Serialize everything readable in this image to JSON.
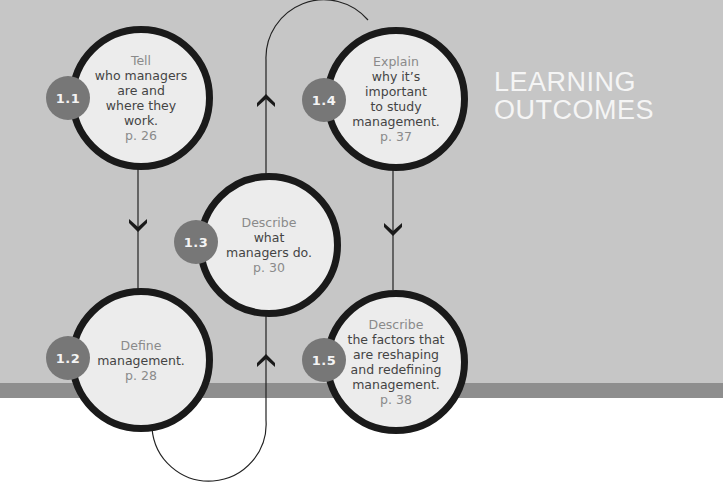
{
  "title": {
    "line1": "LEARNING",
    "line2": "OUTCOMES"
  },
  "colors": {
    "background": "#c6c6c6",
    "band": "#8e8e8e",
    "circle_fill": "#ececec",
    "circle_border": "#1a1a1a",
    "badge": "#777777"
  },
  "outcomes": [
    {
      "number": "1.1",
      "verb": "Tell",
      "description": [
        "who managers",
        "are and",
        "where they",
        "work."
      ],
      "page": "p. 26"
    },
    {
      "number": "1.2",
      "verb": "Define",
      "description": [
        "management."
      ],
      "page": "p. 28"
    },
    {
      "number": "1.3",
      "verb": "Describe",
      "description": [
        "what",
        "managers do."
      ],
      "page": "p. 30"
    },
    {
      "number": "1.4",
      "verb": "Explain",
      "description": [
        "why it’s",
        "important",
        "to study",
        "management."
      ],
      "page": "p. 37"
    },
    {
      "number": "1.5",
      "verb": "Describe",
      "description": [
        "the factors that",
        "are reshaping",
        "and redefining",
        "management."
      ],
      "page": "p. 38"
    }
  ]
}
